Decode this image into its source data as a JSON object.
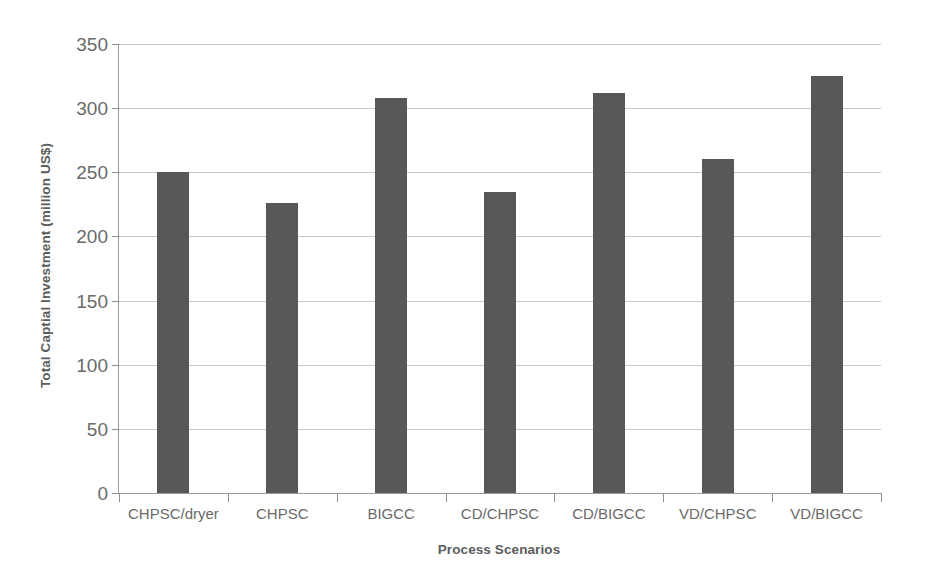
{
  "chart_data": {
    "type": "bar",
    "title": "",
    "xlabel": "Process Scenarios",
    "ylabel": "Total Captial Investment (million US$)",
    "categories": [
      "CHPSC/dryer",
      "CHPSC",
      "BIGCC",
      "CD/CHPSC",
      "CD/BIGCC",
      "VD/CHPSC",
      "VD/BIGCC"
    ],
    "values": [
      250,
      226,
      308,
      235,
      312,
      260,
      325
    ],
    "ylim": [
      0,
      350
    ],
    "ytick_labels": [
      "0",
      "50",
      "100",
      "150",
      "200",
      "250",
      "300",
      "350"
    ],
    "ytick_values": [
      0,
      50,
      100,
      150,
      200,
      250,
      300,
      350
    ],
    "grid": "horizontal",
    "legend": "none",
    "bar_color": "#58585a",
    "gridline_color": "#c9c9c9",
    "axis_color": "#9a9a9a",
    "text_color": "#6a6a6a"
  }
}
